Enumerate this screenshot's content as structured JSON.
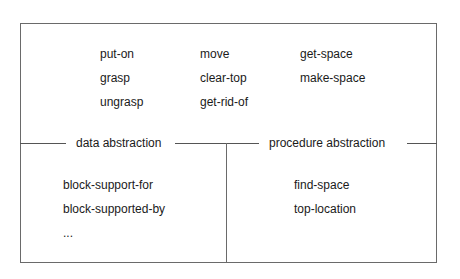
{
  "top_functions": {
    "col1": [
      "put-on",
      "grasp",
      "ungrasp"
    ],
    "col2": [
      "move",
      "clear-top",
      "get-rid-of"
    ],
    "col3": [
      "get-space",
      "make-space"
    ]
  },
  "sections": {
    "data": {
      "label": "data abstraction",
      "items": [
        "block-support-for",
        "block-supported-by",
        "..."
      ]
    },
    "procedure": {
      "label": "procedure abstraction",
      "items": [
        "find-space",
        "top-location"
      ]
    }
  }
}
